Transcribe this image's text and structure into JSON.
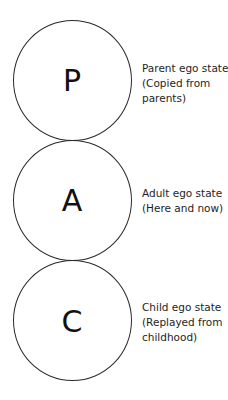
{
  "diagram": {
    "title": "",
    "states": [
      {
        "letter": "P",
        "label_lines": [
          "Parent ego state",
          "(Copied from",
          "parents)"
        ]
      },
      {
        "letter": "A",
        "label_lines": [
          "Adult ego state",
          "(Here and now)"
        ]
      },
      {
        "letter": "C",
        "label_lines": [
          "Child ego state",
          "(Replayed from",
          "childhood)"
        ]
      }
    ],
    "colors": {
      "stroke": "#2a2a2a",
      "text": "#1a1a1a",
      "background": "#ffffff"
    }
  }
}
